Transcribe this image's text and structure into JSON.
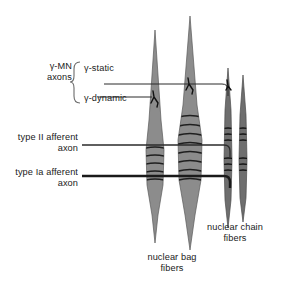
{
  "figure": {
    "width": 282,
    "height": 289,
    "background": "#ffffff"
  },
  "colors": {
    "fiber_fill": "#8c8c8c",
    "fiber_fill_dark": "#6e6e6e",
    "fiber_stroke": "#4a4a4a",
    "wrap_stroke": "#1f1f1f",
    "axon_line": "#2b2b2b",
    "text": "#1a1a1a",
    "bracket": "#6b6b6b"
  },
  "labels": {
    "gamma_mn_axons": "γ-MN\naxons",
    "gamma_static": "γ-static",
    "gamma_dynamic": "γ-dynamic",
    "type_ii_afferent": "type II afferent\naxon",
    "type_ia_afferent": "type Ia afferent\naxon",
    "nuclear_bag_fibers": "nuclear bag\nfibers",
    "nuclear_chain_fibers": "nuclear chain\nfibers"
  },
  "axons": [
    {
      "name": "gamma-static",
      "y": 84,
      "x_start": 104,
      "x_end": 224,
      "weight": 1.0
    },
    {
      "name": "gamma-dynamic",
      "y": 97,
      "x_start": 98,
      "x_end": 155,
      "weight": 1.0
    },
    {
      "name": "type-II",
      "y": 145,
      "x_start": 82,
      "x_end": 230,
      "weight": 1.3
    },
    {
      "name": "type-Ia",
      "y": 176,
      "x_start": 82,
      "x_end": 230,
      "weight": 2.4
    }
  ],
  "intrafusal_fibers": [
    {
      "name": "nuclear-bag-1",
      "kind": "bag",
      "center_x": 155,
      "top_y": 30,
      "bottom_y": 243,
      "max_width": 18
    },
    {
      "name": "nuclear-bag-2",
      "kind": "bag",
      "center_x": 190,
      "top_y": 16,
      "bottom_y": 250,
      "max_width": 24
    },
    {
      "name": "nuclear-chain-1",
      "kind": "chain",
      "center_x": 228,
      "top_y": 68,
      "bottom_y": 228,
      "max_width": 7
    },
    {
      "name": "nuclear-chain-2",
      "kind": "chain",
      "center_x": 243,
      "top_y": 75,
      "bottom_y": 222,
      "max_width": 7
    }
  ]
}
